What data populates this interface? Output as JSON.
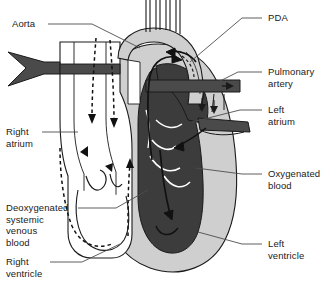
{
  "figure": {
    "type": "anatomical-line-diagram"
  },
  "colors": {
    "oxygenated_fill": "#3c3c3c",
    "myocardium_fill": "#cfcfcf",
    "deoxygenated_fill": "#ffffff",
    "vessel_dark": "#4a4a4a",
    "outline": "#1a1a1a",
    "leader_line": "#4d4d4d",
    "background": "#ffffff"
  },
  "labels": {
    "aorta": "Aorta",
    "pda": "PDA",
    "pulmonary_artery": "Pulmonary\nartery",
    "right_atrium": "Right\natrium",
    "left_atrium": "Left\natrium",
    "oxygenated_blood": "Oxygenated\nblood",
    "deoxygenated_blood": "Deoxygenated\nsystemic\nvenous\nblood",
    "right_ventricle": "Right\nventricle",
    "left_ventricle": "Left\nventricle"
  },
  "legend_semantics": {
    "solid_arrow": "oxygenated blood flow",
    "dashed_arrow": "deoxygenated systemic venous blood flow",
    "dark_gray_region": "oxygenated blood",
    "light_gray_region": "myocardium / heart wall",
    "white_region": "deoxygenated blood"
  }
}
